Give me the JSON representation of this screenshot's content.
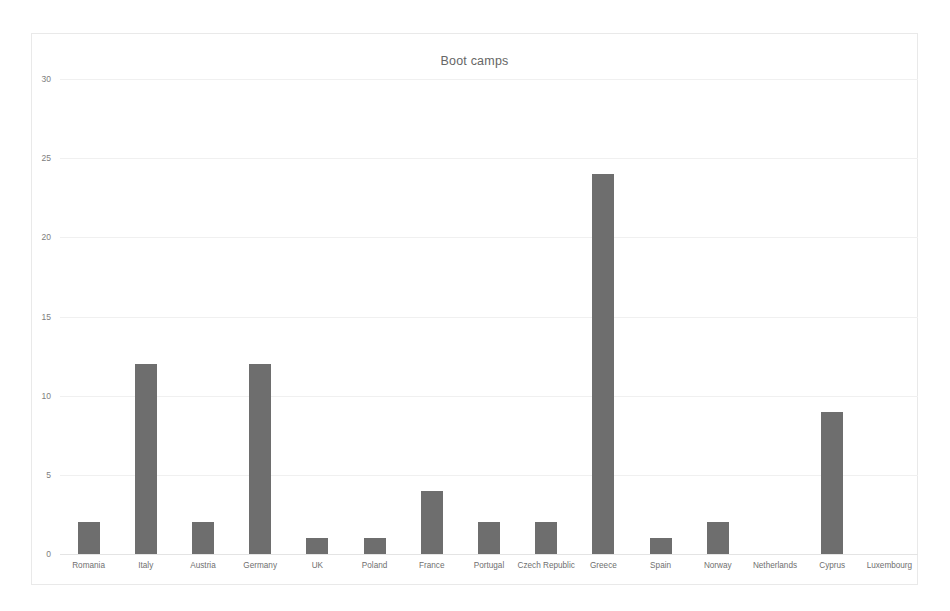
{
  "chart_data": {
    "type": "bar",
    "title": "Boot camps",
    "xlabel": "",
    "ylabel": "",
    "ylim": [
      0,
      30
    ],
    "yticks": [
      0,
      5,
      10,
      15,
      20,
      25,
      30
    ],
    "grid": true,
    "legend": "none",
    "bar_color": "#6e6e6e",
    "categories": [
      "Romania",
      "Italy",
      "Austria",
      "Germany",
      "UK",
      "Poland",
      "France",
      "Portugal",
      "Czech Republic",
      "Greece",
      "Spain",
      "Norway",
      "Netherlands",
      "Cyprus",
      "Luxembourg"
    ],
    "values": [
      2,
      12,
      2,
      12,
      1,
      1,
      4,
      2,
      2,
      24,
      1,
      2,
      0,
      9,
      0
    ]
  }
}
